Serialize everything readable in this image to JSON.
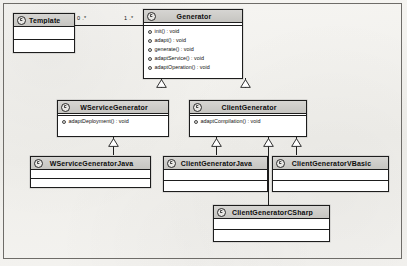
{
  "diagram": {
    "kind": "uml-class-diagram",
    "colors": {
      "header_fill": "#cecdc9",
      "box_fill": "#ffffff",
      "line": "#1d1d1d",
      "paper": "#f3f2ef"
    }
  },
  "classes": {
    "template": {
      "name": "Template",
      "operations": []
    },
    "generator": {
      "name": "Generator",
      "operations": [
        "init() : void",
        "adapt() : void",
        "generate() : void",
        "adaptService() : void",
        "adaptOperation() : void"
      ]
    },
    "wservice_generator": {
      "name": "WServiceGenerator",
      "operations": [
        "adaptDeployment() : void"
      ]
    },
    "client_generator": {
      "name": "ClientGenerator",
      "operations": [
        "adaptCompilation() : void"
      ]
    },
    "wservice_generator_java": {
      "name": "WServiceGeneratorJava",
      "operations": []
    },
    "client_generator_java": {
      "name": "ClientGeneratorJava",
      "operations": []
    },
    "client_generator_vbasic": {
      "name": "ClientGeneratorVBasic",
      "operations": []
    },
    "client_generator_csharp": {
      "name": "ClientGeneratorCSharp",
      "operations": []
    }
  },
  "associations": [
    {
      "id": "template-generator",
      "source": "Template",
      "target": "Generator",
      "source_multiplicity": "0 .*",
      "target_multiplicity": "1 .*"
    }
  ],
  "generalizations": [
    {
      "child": "WServiceGenerator",
      "parent": "Generator"
    },
    {
      "child": "ClientGenerator",
      "parent": "Generator"
    },
    {
      "child": "WServiceGeneratorJava",
      "parent": "WServiceGenerator"
    },
    {
      "child": "ClientGeneratorJava",
      "parent": "ClientGenerator"
    },
    {
      "child": "ClientGeneratorCSharp",
      "parent": "ClientGenerator"
    },
    {
      "child": "ClientGeneratorVBasic",
      "parent": "ClientGenerator"
    }
  ],
  "icons": {
    "class_icon": "class-circle-icon",
    "visibility_marker": "visibility-dot-icon",
    "generalization_arrow": "hollow-triangle-icon"
  }
}
